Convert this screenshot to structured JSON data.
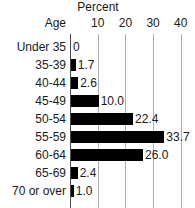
{
  "chart_data": {
    "type": "bar",
    "orientation": "horizontal",
    "title": "Percent",
    "xlabel": "",
    "ylabel": "Age",
    "categories": [
      "Under 35",
      "35-39",
      "40-44",
      "45-49",
      "50-54",
      "55-59",
      "60-64",
      "65-69",
      "70 or over"
    ],
    "values": [
      0,
      1.7,
      2.6,
      10.0,
      22.4,
      33.7,
      26.0,
      2.4,
      1.0
    ],
    "value_labels": [
      "0",
      "1.7",
      "2.6",
      "10.0",
      "22.4",
      "33.7",
      "26.0",
      "2.4",
      "1.0"
    ],
    "xticks": [
      10,
      20,
      30,
      40
    ],
    "xtick_labels": [
      "10",
      "20",
      "30",
      "40"
    ],
    "xlim": [
      0,
      45
    ],
    "grid": true,
    "legend": false,
    "bar_color": "#000000",
    "grid_color": "#aeaeae",
    "axis_color": "#4a4a4a",
    "text_color": "#1a1a1a"
  }
}
